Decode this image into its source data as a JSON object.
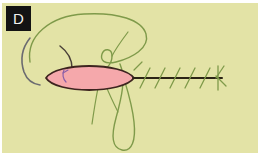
{
  "figure": {
    "panel_label": "D",
    "medium": "hand-drawn ink and marker sketch on pale yellow-green paper"
  },
  "colors": {
    "paper_background": "#e3e3a6",
    "page_margin": "#ffffff",
    "label_box": "#131313",
    "label_text": "#f2f2ef",
    "cell_body_fill": "#f5a8ab",
    "cell_body_outline": "#3d241f",
    "tail_axis": "#2b2415",
    "green_marker": "#7f9a4a",
    "gray_arc": "#6b6b70",
    "purple_mark": "#8a5fa8"
  },
  "elements": {
    "cell_body": {
      "name": "pink lens-shaped cell body",
      "fill": "#f5a8ab",
      "outline": "#3d241f",
      "center_x": 90,
      "center_y": 78,
      "half_width": 44,
      "half_height": 15
    },
    "tail": {
      "name": "horizontal flagellum axis with angled barbs",
      "start_x": 134,
      "end_x": 222,
      "y": 78,
      "barb_count": 6
    },
    "green_loop_upper": {
      "name": "large green marker loop arching over the cell",
      "stroke": "#7f9a4a"
    },
    "green_loop_lower": {
      "name": "narrow green marker loop descending below the cell",
      "stroke": "#7f9a4a"
    },
    "gray_arc": {
      "name": "gray-blue arc at left",
      "stroke": "#6b6b70"
    },
    "purple_mark": {
      "name": "small purple tick inside cell body",
      "stroke": "#8a5fa8"
    },
    "tail_tip_cluster": {
      "name": "small green cluster at tail tip",
      "stroke": "#7f9a4a"
    }
  }
}
